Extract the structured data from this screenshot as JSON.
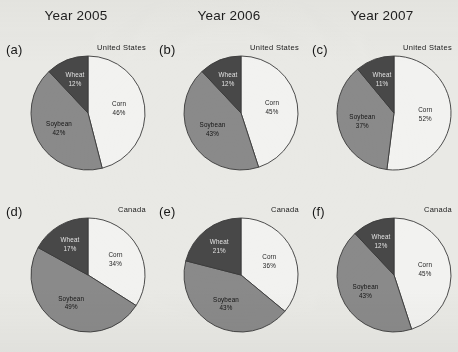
{
  "figure": {
    "background_color": "#e9e9e5",
    "column_titles": [
      "Year 2005",
      "Year 2006",
      "Year 2007"
    ],
    "series_colors": {
      "corn": "#f2f2f0",
      "soybean": "#8a8a8a",
      "wheat": "#484848",
      "outline": "#3a3a3a"
    }
  },
  "chart_data": [
    {
      "type": "pie",
      "title": "Year 2005",
      "panel": "(a)",
      "region": "United States",
      "categories": [
        "Corn",
        "Soybean",
        "Wheat"
      ],
      "values": [
        46,
        42,
        12
      ],
      "labels": [
        "Corn",
        "Soybean",
        "Wheat"
      ],
      "value_labels": [
        "46%",
        "42%",
        "12%"
      ],
      "colors": [
        "#f2f2f0",
        "#8a8a8a",
        "#484848"
      ],
      "start_angle_deg": 0,
      "direction": "clockwise",
      "units": "percent"
    },
    {
      "type": "pie",
      "title": "Year 2006",
      "panel": "(b)",
      "region": "United States",
      "categories": [
        "Corn",
        "Soybean",
        "Wheat"
      ],
      "values": [
        45,
        43,
        12
      ],
      "labels": [
        "Corn",
        "Soybean",
        "Wheat"
      ],
      "value_labels": [
        "45%",
        "43%",
        "12%"
      ],
      "colors": [
        "#f2f2f0",
        "#8a8a8a",
        "#484848"
      ],
      "start_angle_deg": 0,
      "direction": "clockwise",
      "units": "percent"
    },
    {
      "type": "pie",
      "title": "Year 2007",
      "panel": "(c)",
      "region": "United States",
      "categories": [
        "Corn",
        "Soybean",
        "Wheat"
      ],
      "values": [
        52,
        37,
        11
      ],
      "labels": [
        "Corn",
        "Soybean",
        "Wheat"
      ],
      "value_labels": [
        "52%",
        "37%",
        "11%"
      ],
      "colors": [
        "#f2f2f0",
        "#8a8a8a",
        "#484848"
      ],
      "start_angle_deg": 0,
      "direction": "clockwise",
      "units": "percent"
    },
    {
      "type": "pie",
      "title": "Year 2005",
      "panel": "(d)",
      "region": "Canada",
      "categories": [
        "Corn",
        "Soybean",
        "Wheat"
      ],
      "values": [
        34,
        49,
        17
      ],
      "labels": [
        "Corn",
        "Soybean",
        "Wheat"
      ],
      "value_labels": [
        "34%",
        "49%",
        "17%"
      ],
      "colors": [
        "#f2f2f0",
        "#8a8a8a",
        "#484848"
      ],
      "start_angle_deg": 0,
      "direction": "clockwise",
      "units": "percent"
    },
    {
      "type": "pie",
      "title": "Year 2006",
      "panel": "(e)",
      "region": "Canada",
      "categories": [
        "Corn",
        "Soybean",
        "Wheat"
      ],
      "values": [
        36,
        43,
        21
      ],
      "labels": [
        "Corn",
        "Soybean",
        "Wheat"
      ],
      "value_labels": [
        "36%",
        "43%",
        "21%"
      ],
      "colors": [
        "#f2f2f0",
        "#8a8a8a",
        "#484848"
      ],
      "start_angle_deg": 0,
      "direction": "clockwise",
      "units": "percent"
    },
    {
      "type": "pie",
      "title": "Year 2007",
      "panel": "(f)",
      "region": "Canada",
      "categories": [
        "Corn",
        "Soybean",
        "Wheat"
      ],
      "values": [
        45,
        43,
        12
      ],
      "labels": [
        "Corn",
        "Soybean",
        "Wheat"
      ],
      "value_labels": [
        "45%",
        "43%",
        "12%"
      ],
      "colors": [
        "#f2f2f0",
        "#8a8a8a",
        "#484848"
      ],
      "start_angle_deg": 0,
      "direction": "clockwise",
      "units": "percent"
    }
  ]
}
